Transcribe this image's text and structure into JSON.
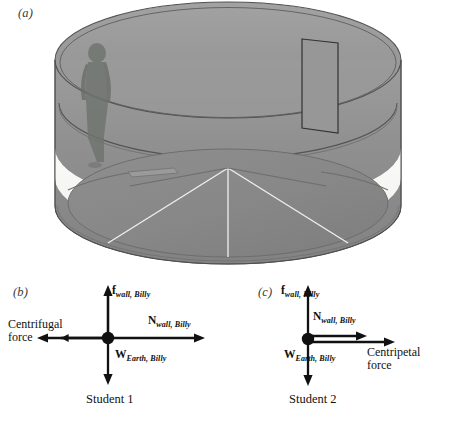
{
  "figure": {
    "panels": [
      {
        "id": "a",
        "tag": "(a)"
      },
      {
        "id": "b",
        "tag": "(b)"
      },
      {
        "id": "c",
        "tag": "(c)"
      }
    ]
  },
  "rotor": {
    "description": "Rotor amusement ride: large rotating cylindrical drum with a person standing against the inner wall, a door on the far wall, and a segmented floor disc",
    "colors": {
      "wall_outer": "#8d8d8d",
      "wall_inner": "#9a9a9a",
      "floor": "#8a8a8a",
      "highlight_band": "#f7f7f5",
      "person": "#6e7370",
      "outline": "#4a4a4a"
    }
  },
  "fbd_left": {
    "panel_tag": "(b)",
    "origin_label": "Billy",
    "vectors": [
      {
        "name": "friction-up",
        "symbol": "f",
        "subscript": "wall, Billy",
        "direction": "up",
        "label_x": 112,
        "label_y": 13
      },
      {
        "name": "normal-left",
        "symbol": "N",
        "subscript": "wall, Billy",
        "direction": "right",
        "label_x": 148,
        "label_y": 42
      },
      {
        "name": "weight-down",
        "symbol": "W",
        "subscript": "Earth, Billy",
        "direction": "down",
        "label_x": 116,
        "label_y": 74
      }
    ],
    "frame_force": {
      "line1": "Centrifugal",
      "line2": "force"
    },
    "caption": "Student 1"
  },
  "fbd_right": {
    "panel_tag": "(c)",
    "origin_label": "Billy",
    "vectors": [
      {
        "name": "friction-up",
        "symbol": "f",
        "subscript": "wall, Billy",
        "direction": "up",
        "label_x": 54,
        "label_y": 13
      },
      {
        "name": "normal-right",
        "symbol": "N",
        "subscript": "wall, Billy",
        "direction": "right",
        "label_x": 86,
        "label_y": 38
      },
      {
        "name": "weight-down",
        "symbol": "W",
        "subscript": "Earth, Billy",
        "direction": "down",
        "label_x": 58,
        "label_y": 74
      }
    ],
    "frame_force": {
      "line1": "Centripetal",
      "line2": "force"
    },
    "caption": "Student 2"
  }
}
